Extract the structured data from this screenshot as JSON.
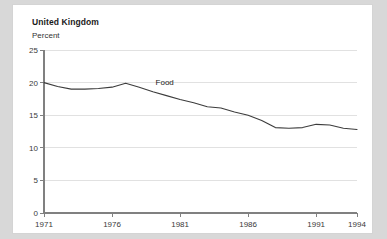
{
  "card": {
    "background_color": "#ffffff",
    "page_background_color": "#d8d8d8"
  },
  "chart_data": {
    "type": "line",
    "title": "United Kingdom",
    "subtitle": "",
    "xlabel": "",
    "ylabel": "Percent",
    "ylim": [
      0,
      25
    ],
    "xlim": [
      1971,
      1994
    ],
    "yticks": [
      0,
      5,
      10,
      15,
      20,
      25
    ],
    "ytick_labels": [
      "0",
      "5",
      "10",
      "15",
      "20",
      "25"
    ],
    "xticks": [
      1971,
      1976,
      1981,
      1986,
      1991,
      1994
    ],
    "xtick_labels": [
      "1971",
      "1976",
      "1981",
      "1986",
      "1991",
      "1994"
    ],
    "grid": true,
    "grid_axis": "y",
    "grid_color": "#d9d9d9",
    "axis_color": "#808080",
    "legend": "inline-annotation",
    "legend_position": "on-line",
    "series": [
      {
        "name": "Food",
        "color": "#3c3c3c",
        "annotation": "Food",
        "x": [
          1971,
          1972,
          1973,
          1974,
          1975,
          1976,
          1977,
          1978,
          1979,
          1980,
          1981,
          1982,
          1983,
          1984,
          1985,
          1986,
          1987,
          1988,
          1989,
          1990,
          1991,
          1992,
          1993,
          1994
        ],
        "values": [
          20.0,
          19.4,
          19.0,
          19.0,
          19.1,
          19.3,
          19.9,
          19.3,
          18.6,
          18.0,
          17.4,
          16.9,
          16.3,
          16.1,
          15.5,
          15.0,
          14.2,
          13.1,
          13.0,
          13.1,
          13.6,
          13.5,
          13.0,
          12.8
        ]
      }
    ]
  }
}
